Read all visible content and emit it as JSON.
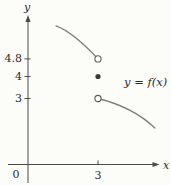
{
  "figure": {
    "background_color": "#fcfcf9",
    "curve_color": "#7d7d7a",
    "axis_color": "#4a4a47",
    "point_color": "#3b3b38",
    "text_color": "#2e2c29"
  },
  "chart_data": {
    "type": "line",
    "title": "",
    "xlabel": "x",
    "ylabel": "y",
    "annotation": "y = f(x)",
    "origin_label": "0",
    "xlim": [
      0,
      5.6
    ],
    "ylim": [
      0,
      6.8
    ],
    "grid": false,
    "x_ticks": [
      {
        "value": 3,
        "label": "3"
      }
    ],
    "y_ticks": [
      {
        "value": 4.8,
        "label": "4.8"
      },
      {
        "value": 4,
        "label": "4"
      },
      {
        "value": 3,
        "label": "3"
      }
    ],
    "branches": [
      {
        "name": "left-branch",
        "start": [
          1.2,
          6.3
        ],
        "control": [
          1.93,
          6.02
        ],
        "end": [
          3.0,
          4.8
        ],
        "open_end": "end"
      },
      {
        "name": "right-branch",
        "start": [
          3.0,
          3.0
        ],
        "control": [
          4.5,
          2.61
        ],
        "end": [
          5.44,
          1.66
        ],
        "open_end": "start"
      }
    ],
    "points": [
      {
        "x": 3,
        "y": 4.8,
        "style": "open"
      },
      {
        "x": 3,
        "y": 4,
        "style": "filled"
      },
      {
        "x": 3,
        "y": 3,
        "style": "open"
      }
    ]
  }
}
